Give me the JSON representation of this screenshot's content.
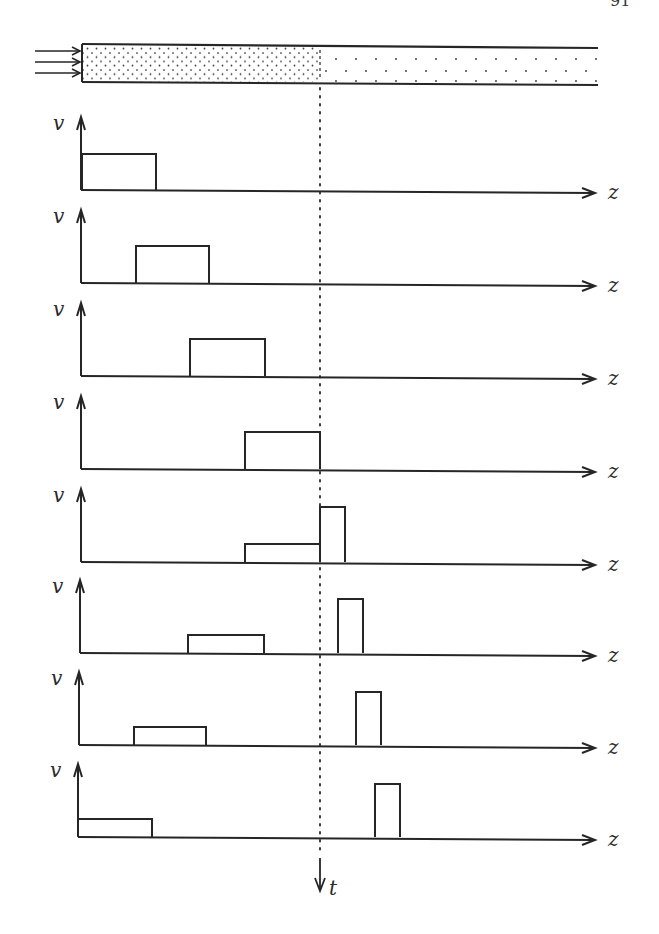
{
  "page": {
    "number": "91"
  },
  "tube": {
    "x_start": 82,
    "x_end": 598,
    "front_x": 320,
    "dense_region": "packed solute",
    "sparse_region": "dilute solute",
    "inflow_arrows": 3
  },
  "axes": {
    "y_label": "v",
    "x_label": "z",
    "time_label": "t"
  },
  "chart_data": {
    "type": "diagram",
    "title": "",
    "xlabel": "z",
    "ylabel": "v",
    "time_axis": "t (downward)",
    "front_position_px": 320,
    "panels": [
      {
        "index": 1,
        "baseline": 190,
        "pulses": [
          {
            "x0": 82,
            "x1": 156,
            "top": 154
          }
        ]
      },
      {
        "index": 2,
        "baseline": 283,
        "pulses": [
          {
            "x0": 136,
            "x1": 209,
            "top": 246
          }
        ]
      },
      {
        "index": 3,
        "baseline": 376,
        "pulses": [
          {
            "x0": 190,
            "x1": 265,
            "top": 339
          }
        ]
      },
      {
        "index": 4,
        "baseline": 469,
        "pulses": [
          {
            "x0": 245,
            "x1": 320,
            "top": 432
          }
        ]
      },
      {
        "index": 5,
        "baseline": 562,
        "pulses": [
          {
            "x0": 245,
            "x1": 320,
            "top": 544
          },
          {
            "x0": 320,
            "x1": 345,
            "top": 507
          }
        ]
      },
      {
        "index": 6,
        "baseline": 653,
        "pulses": [
          {
            "x0": 188,
            "x1": 264,
            "top": 635
          },
          {
            "x0": 338,
            "x1": 363,
            "top": 599
          }
        ]
      },
      {
        "index": 7,
        "baseline": 745,
        "pulses": [
          {
            "x0": 134,
            "x1": 206,
            "top": 727
          },
          {
            "x0": 356,
            "x1": 381,
            "top": 692
          }
        ]
      },
      {
        "index": 8,
        "baseline": 837,
        "pulses": [
          {
            "x0": 78,
            "x1": 152,
            "top": 819
          },
          {
            "x0": 375,
            "x1": 400,
            "top": 784
          }
        ]
      }
    ]
  },
  "colors": {
    "ink": "#262626",
    "paper": "#ffffff"
  }
}
